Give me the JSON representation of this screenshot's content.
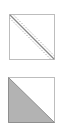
{
  "icons": [
    {
      "name": "diagonal-line-with-tolerance-icon",
      "description": "Square with a solid diagonal and dotted parallel lines on both sides",
      "border_color": "#bdbdbd",
      "line_color": "#8a8a8a",
      "dotted_color": "#b0b0b0"
    },
    {
      "name": "half-filled-triangle-icon",
      "description": "Square with lower-left triangle filled grey",
      "border_color": "#bdbdbd",
      "fill_color": "#b3b3b3",
      "edge_color": "#8f8f8f"
    }
  ]
}
